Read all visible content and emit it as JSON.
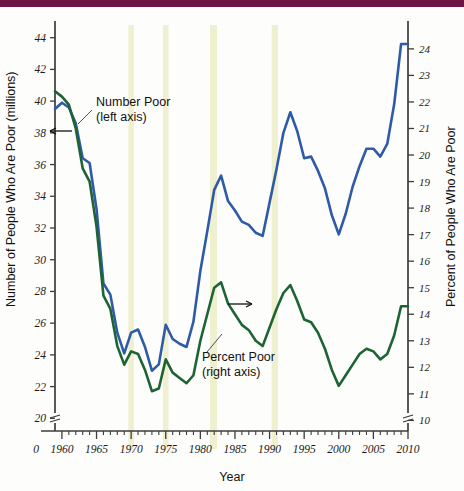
{
  "header": {
    "bar_color": "#6d1542"
  },
  "chart_data": {
    "type": "line",
    "title": "",
    "xlabel": "Year",
    "ylabel": "Number of People Who Are Poor (millions)",
    "ylabel_right": "Percent of People Who Are Poor",
    "xlim": [
      1959,
      2010
    ],
    "ylim": [
      19.2,
      44.8
    ],
    "ylim_right": [
      9.6,
      24.9
    ],
    "grid": false,
    "legend_position": "inline-annotations",
    "x_ticks_major": [
      1960,
      1965,
      1970,
      1975,
      1980,
      1985,
      1990,
      1995,
      2000,
      2005,
      2010
    ],
    "x_tick_labels": [
      "1960",
      "1965",
      "1970",
      "1975",
      "1980",
      "1985",
      "1990",
      "1995",
      "2000",
      "2005",
      "2010"
    ],
    "x_origin_label": "0",
    "y_ticks_left": [
      20,
      22,
      24,
      26,
      28,
      30,
      32,
      34,
      36,
      38,
      40,
      42,
      44
    ],
    "y_tick_labels_left": [
      "20",
      "22",
      "24",
      "26",
      "28",
      "30",
      "32",
      "34",
      "36",
      "38",
      "40",
      "42",
      "44"
    ],
    "y_ticks_right": [
      10,
      11,
      12,
      13,
      14,
      15,
      16,
      17,
      18,
      19,
      20,
      21,
      22,
      23,
      24
    ],
    "y_tick_labels_right": [
      "10",
      "11",
      "12",
      "13",
      "14",
      "15",
      "16",
      "17",
      "18",
      "19",
      "20",
      "21",
      "22",
      "23",
      "24"
    ],
    "axis_break_left": true,
    "axis_break_right": true,
    "shaded_bands": [
      {
        "start": 1969.6,
        "end": 1970.4,
        "label": "recession"
      },
      {
        "start": 1974.6,
        "end": 1975.4,
        "label": "recession"
      },
      {
        "start": 1981.4,
        "end": 1982.4,
        "label": "recession"
      },
      {
        "start": 1990.3,
        "end": 1991.2,
        "label": "recession"
      }
    ],
    "x": [
      1959,
      1960,
      1961,
      1962,
      1963,
      1964,
      1965,
      1966,
      1967,
      1968,
      1969,
      1970,
      1971,
      1972,
      1973,
      1974,
      1975,
      1976,
      1977,
      1978,
      1979,
      1980,
      1981,
      1982,
      1983,
      1984,
      1985,
      1986,
      1987,
      1988,
      1989,
      1990,
      1991,
      1992,
      1993,
      1994,
      1995,
      1996,
      1997,
      1998,
      1999,
      2000,
      2001,
      2002,
      2003,
      2004,
      2005,
      2006,
      2007,
      2008,
      2009,
      2010
    ],
    "series": [
      {
        "name": "Number Poor",
        "axis": "left",
        "color": "#2e5aa8",
        "units": "millions",
        "annotation": "Number Poor (left axis)",
        "values": [
          39.5,
          39.9,
          39.6,
          38.6,
          36.4,
          36.1,
          33.2,
          28.5,
          27.8,
          25.4,
          24.1,
          25.4,
          25.6,
          24.5,
          23.0,
          23.4,
          25.9,
          25.0,
          24.7,
          24.5,
          26.1,
          29.3,
          31.8,
          34.4,
          35.3,
          33.7,
          33.1,
          32.4,
          32.2,
          31.7,
          31.5,
          33.6,
          35.7,
          38.0,
          39.3,
          38.1,
          36.4,
          36.5,
          35.6,
          34.5,
          32.8,
          31.6,
          32.9,
          34.6,
          35.9,
          37.0,
          37.0,
          36.5,
          37.3,
          39.8,
          43.6,
          43.6
        ]
      },
      {
        "name": "Percent Poor",
        "axis": "right",
        "color": "#1d6334",
        "units": "percent",
        "annotation": "Percent Poor (right axis)",
        "values": [
          22.4,
          22.2,
          21.9,
          21.0,
          19.5,
          19.0,
          17.3,
          14.7,
          14.2,
          12.8,
          12.1,
          12.6,
          12.5,
          11.9,
          11.1,
          11.2,
          12.3,
          11.8,
          11.6,
          11.4,
          11.7,
          13.0,
          14.0,
          15.0,
          15.2,
          14.4,
          14.0,
          13.6,
          13.4,
          13.0,
          12.8,
          13.5,
          14.2,
          14.8,
          15.1,
          14.5,
          13.8,
          13.7,
          13.3,
          12.7,
          11.9,
          11.3,
          11.7,
          12.1,
          12.5,
          12.7,
          12.6,
          12.3,
          12.5,
          13.2,
          14.3,
          14.3
        ]
      }
    ]
  },
  "annotations": [
    {
      "id": "number-poor",
      "line1": "Number Poor",
      "line2": "(left axis)"
    },
    {
      "id": "percent-poor",
      "line1": "Percent Poor",
      "line2": "(right axis)"
    }
  ]
}
